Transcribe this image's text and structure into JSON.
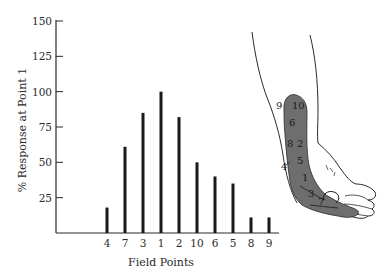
{
  "chart_data": {
    "type": "bar",
    "title": "",
    "xlabel": "Field Points",
    "ylabel": "% Response at Point 1",
    "ylim": [
      0,
      150
    ],
    "yticks": [
      25,
      50,
      75,
      100,
      125,
      150
    ],
    "grid": false,
    "legend": null,
    "categories": [
      "4",
      "7",
      "3",
      "1",
      "2",
      "10",
      "6",
      "5",
      "8",
      "9"
    ],
    "values": [
      18,
      61,
      85,
      100,
      82,
      50,
      40,
      35,
      11,
      11
    ]
  },
  "illustration": {
    "description": "Line drawing of a forearm and hand with a shaded gray receptive-field strip along the ulnar side, numbered field points",
    "shade_color": "#6e6e6e",
    "labels_inside": [
      "10",
      "6",
      "2",
      "5",
      "1",
      "3",
      "7"
    ],
    "labels_outside": [
      "9",
      "8",
      "4"
    ]
  },
  "colors": {
    "bar": "#1a1a1a",
    "axis": "#2a2a2a",
    "background": "#ffffff"
  }
}
